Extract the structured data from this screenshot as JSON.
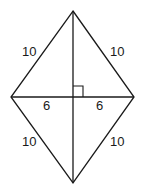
{
  "diagram": {
    "shape": "rhombus",
    "colors": {
      "stroke": "#1a1a1a",
      "background": "#ffffff"
    },
    "vertices": {
      "top": [
        73,
        11
      ],
      "left": [
        11,
        97
      ],
      "right": [
        134,
        97
      ],
      "bottom": [
        73,
        183
      ]
    },
    "labels": {
      "upper_left_side": "10",
      "upper_right_side": "10",
      "lower_left_side": "10",
      "lower_right_side": "10",
      "left_half_diagonal": "6",
      "right_half_diagonal": "6"
    },
    "right_angle_marker": true
  }
}
